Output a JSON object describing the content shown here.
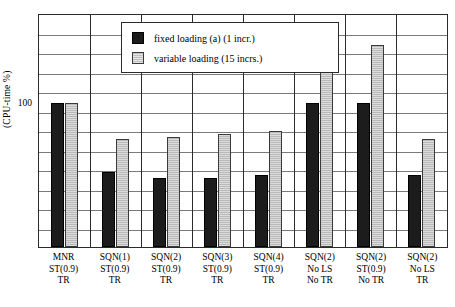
{
  "chart_data": {
    "type": "bar",
    "title": "",
    "xlabel": "",
    "ylabel": "(CPU-time %)",
    "ylim": [
      0,
      162
    ],
    "grid": true,
    "gridline_step": 13.5,
    "gridline_count": 11,
    "legend_position": "top-center",
    "y_ticks": [
      "100"
    ],
    "categories": [
      "MNR ST(0.9) TR",
      "SQN(1) ST(0.9) TR",
      "SQN(2) ST(0.9) TR",
      "SQN(3) ST(0.9) TR",
      "SQN(4) ST(0.9) TR",
      "SQN(2) No LS No TR",
      "SQN(2) ST(0.9) No TR",
      "SQN(2) No LS TR"
    ],
    "category_lines": [
      [
        "MNR",
        "ST(0.9)",
        "TR"
      ],
      [
        "SQN(1)",
        "ST(0.9)",
        "TR"
      ],
      [
        "SQN(2)",
        "ST(0.9)",
        "TR"
      ],
      [
        "SQN(3)",
        "ST(0.9)",
        "TR"
      ],
      [
        "SQN(4)",
        "ST(0.9)",
        "TR"
      ],
      [
        "SQN(2)",
        "No LS",
        "No TR"
      ],
      [
        "SQN(2)",
        "ST(0.9)",
        "No TR"
      ],
      [
        "SQN(2)",
        "No LS",
        "TR"
      ]
    ],
    "series": [
      {
        "name": "fixed loading (a) (1 incr.)",
        "color": "#1c1c1c",
        "values": [
          100,
          52,
          48,
          48,
          50,
          100,
          100,
          50
        ]
      },
      {
        "name": "variable loading (15 incrs.)",
        "color": "#b9b9b9",
        "values": [
          100,
          75,
          76,
          78,
          80,
          140,
          140,
          75
        ]
      }
    ]
  },
  "axis": {
    "y_title": "(CPU-time %)",
    "y_tick_100": "100"
  },
  "legend": {
    "entries": [
      {
        "label": "fixed loading (a) (1 incr.)",
        "swatch": "dark"
      },
      {
        "label": "variable loading (15 incrs.)",
        "swatch": "light"
      }
    ]
  }
}
